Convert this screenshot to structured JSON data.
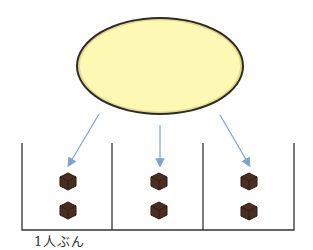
{
  "diagram": {
    "source": {
      "shape": "ellipse",
      "fill": "#fdf9b4",
      "stroke": "#2a2a2a"
    },
    "arrow_color": "#7fa3cf",
    "compartments": [
      {
        "items": 2,
        "item": "cube"
      },
      {
        "items": 2,
        "item": "cube"
      },
      {
        "items": 2,
        "item": "cube"
      }
    ],
    "cube_color": "#4a2e22",
    "label": "1人ぶん"
  }
}
